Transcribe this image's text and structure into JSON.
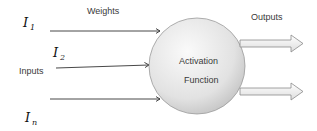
{
  "diagram": {
    "labels": {
      "weights": "Weights",
      "inputs": "Inputs",
      "outputs": "Outputs",
      "activation_line1": "Activation",
      "activation_line2": "Function"
    },
    "inputs": [
      {
        "symbol": "I",
        "subscript": "1"
      },
      {
        "symbol": "I",
        "subscript": "2"
      },
      {
        "symbol": "I",
        "subscript": "n"
      }
    ],
    "colors": {
      "circle_fill_light": "#f4f4f4",
      "circle_fill_dark": "#c8c8c8",
      "circle_stroke": "#9a9a9a",
      "arrow_stroke": "#333333",
      "output_arrow_fill": "#f0f0f0",
      "output_arrow_stroke": "#888888"
    }
  }
}
